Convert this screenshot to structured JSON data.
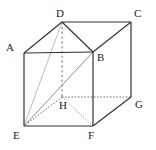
{
  "figure": {
    "type": "geometric-diagram",
    "background_color": "#ffffff",
    "canvas": {
      "width": 156,
      "height": 150
    },
    "colors": {
      "solid_edge": "#333333",
      "hidden_edge": "#6e6e6e",
      "diagonal_light": "#b4b4b4",
      "diagonal_medium": "#8a8a8a",
      "label_text": "#1a1a1a"
    },
    "vertices": [
      {
        "name": "A",
        "label": "A",
        "x": 24,
        "y": 53,
        "label_x": 6,
        "label_y": 42
      },
      {
        "name": "B",
        "label": "B",
        "x": 93,
        "y": 52,
        "label_x": 97,
        "label_y": 52
      },
      {
        "name": "C",
        "label": "C",
        "x": 131,
        "y": 22,
        "label_x": 134,
        "label_y": 8
      },
      {
        "name": "D",
        "label": "D",
        "x": 62,
        "y": 22,
        "label_x": 56,
        "label_y": 8
      },
      {
        "name": "E",
        "label": "E",
        "x": 24,
        "y": 126,
        "label_x": 13,
        "label_y": 130
      },
      {
        "name": "F",
        "label": "F",
        "x": 93,
        "y": 126,
        "label_x": 88,
        "label_y": 130
      },
      {
        "name": "G",
        "label": "G",
        "x": 131,
        "y": 97,
        "label_x": 135,
        "label_y": 99
      },
      {
        "name": "H",
        "label": "H",
        "x": 62,
        "y": 97,
        "label_x": 59,
        "label_y": 100
      }
    ],
    "edges": [
      {
        "name": "edge-A-B",
        "from": "A",
        "to": "B",
        "style": "solid",
        "hidden": false
      },
      {
        "name": "edge-A-D",
        "from": "A",
        "to": "D",
        "style": "solid",
        "hidden": false
      },
      {
        "name": "edge-A-E",
        "from": "A",
        "to": "E",
        "style": "solid",
        "hidden": false
      },
      {
        "name": "edge-D-C",
        "from": "D",
        "to": "C",
        "style": "solid",
        "hidden": false
      },
      {
        "name": "edge-B-C",
        "from": "B",
        "to": "C",
        "style": "solid",
        "hidden": false
      },
      {
        "name": "edge-B-F",
        "from": "B",
        "to": "F",
        "style": "solid",
        "hidden": false
      },
      {
        "name": "edge-C-G",
        "from": "C",
        "to": "G",
        "style": "solid",
        "hidden": false
      },
      {
        "name": "edge-E-F",
        "from": "E",
        "to": "F",
        "style": "solid",
        "hidden": false
      },
      {
        "name": "edge-F-G",
        "from": "F",
        "to": "G",
        "style": "solid",
        "hidden": false
      },
      {
        "name": "edge-D-H",
        "from": "D",
        "to": "H",
        "style": "dashed",
        "hidden": true
      },
      {
        "name": "edge-H-E",
        "from": "H",
        "to": "E",
        "style": "dotted",
        "hidden": true
      },
      {
        "name": "edge-H-F",
        "from": "H",
        "to": "F",
        "style": "dotted",
        "hidden": true
      },
      {
        "name": "edge-H-G",
        "from": "H",
        "to": "G",
        "style": "dotted",
        "hidden": true
      }
    ],
    "diagonals": [
      {
        "name": "diagonal-E-D",
        "from": "E",
        "to": "D",
        "style": "solid",
        "shade": "light"
      },
      {
        "name": "diagonal-E-B",
        "from": "E",
        "to": "B",
        "style": "solid",
        "shade": "medium"
      },
      {
        "name": "diagonal-D-B",
        "from": "D",
        "to": "B",
        "style": "solid",
        "shade": "dark"
      }
    ]
  }
}
